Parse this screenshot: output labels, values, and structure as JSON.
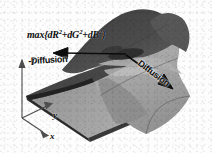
{
  "figure": {
    "background_color": "#fdfdfd",
    "width": 212,
    "height": 153
  },
  "labels": {
    "formula_prefix": "max{dR",
    "formula_sup1": "2",
    "formula_mid1": "+dG",
    "formula_sup2": "2",
    "formula_mid2": "+dB",
    "formula_sup3": "2",
    "formula_suffix": "}",
    "formula_plain": "max{dR2+dG2+dB2}",
    "negative_diffusion": "-Diffusion",
    "positive_diffusion": "Diffusion"
  },
  "axes": {
    "vertical": "I",
    "depth": "y",
    "horizontal": "x"
  },
  "colors": {
    "surface_dark": "#4a4a4a",
    "surface_mid": "#6e6e6e",
    "surface_light": "#a8a8a8",
    "surface_lighter": "#bcbcbc",
    "base_sheet": "#9a9a9a",
    "edge_dark": "#2e2e2e",
    "arrow": "#0d0d0d",
    "axis": "#4f4f4f",
    "text": "#0d0d0d",
    "background": "#fdfdfd"
  },
  "arrows": {
    "negative": {
      "label": "-Diffusion",
      "direction": "left",
      "from_x": 126,
      "from_y": 54,
      "to_x": 55,
      "to_y": 53
    },
    "positive": {
      "label": "Diffusion",
      "direction": "down-right",
      "from_x": 126,
      "from_y": 55,
      "to_x": 172,
      "to_y": 88
    }
  }
}
